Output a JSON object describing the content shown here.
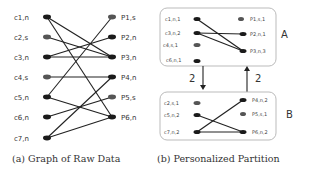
{
  "panel_a": {
    "caption": "(a) Graph of Raw Data",
    "left_nodes": [
      {
        "label": "c1,n",
        "type": "n"
      },
      {
        "label": "c2,s",
        "type": "s"
      },
      {
        "label": "c3,n",
        "type": "n"
      },
      {
        "label": "c4,s",
        "type": "s"
      },
      {
        "label": "c5,n",
        "type": "n"
      },
      {
        "label": "c6,n",
        "type": "n"
      },
      {
        "label": "c7,n",
        "type": "n"
      }
    ],
    "right_nodes": [
      {
        "label": "P1,s",
        "type": "s"
      },
      {
        "label": "P2,n",
        "type": "n"
      },
      {
        "label": "P3,n",
        "type": "n"
      },
      {
        "label": "P4,n",
        "type": "n"
      },
      {
        "label": "P5,s",
        "type": "s"
      },
      {
        "label": "P6,n",
        "type": "n"
      }
    ],
    "edges": [
      [
        "c1",
        "P3"
      ],
      [
        "c1",
        "P6"
      ],
      [
        "c2",
        "P3"
      ],
      [
        "c3",
        "P2"
      ],
      [
        "c3",
        "P3"
      ],
      [
        "c4",
        "P4"
      ],
      [
        "c5",
        "P1"
      ],
      [
        "c5",
        "P6"
      ],
      [
        "c6",
        "P5"
      ],
      [
        "c7",
        "P4"
      ],
      [
        "c7",
        "P6"
      ]
    ]
  },
  "panel_b": {
    "caption": "(b) Personalized Partition",
    "partitions": [
      {
        "name": "A",
        "left_nodes": [
          "c1,n,1",
          "c3,n,2",
          "c4,s,1",
          "c6,n,1"
        ],
        "right_nodes": [
          "P1,s,1",
          "P2,n,1",
          "P3,n,3"
        ],
        "edges": [
          [
            "c1",
            "P3"
          ],
          [
            "c3",
            "P2"
          ],
          [
            "c3",
            "P3"
          ]
        ]
      },
      {
        "name": "B",
        "left_nodes": [
          "c2,s,1",
          "c5,n,2",
          "c7,n,2"
        ],
        "right_nodes": [
          "P4,n,2",
          "P5,s,1",
          "P6,n,2"
        ],
        "edges": [
          [
            "c5",
            "P6"
          ],
          [
            "c7",
            "P4"
          ],
          [
            "c7",
            "P6"
          ]
        ]
      }
    ],
    "arrows": [
      {
        "from": "A",
        "to": "B",
        "weight": "2"
      },
      {
        "from": "B",
        "to": "A",
        "weight": "2"
      }
    ]
  },
  "colors": {
    "node_n": "#1a1a1a",
    "node_s": "#555555",
    "edge": "#222222",
    "box_border": "#bbbbbb"
  }
}
